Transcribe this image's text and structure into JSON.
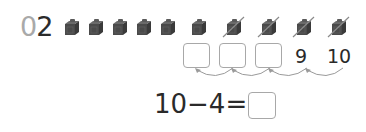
{
  "problem": {
    "number_prefix": "0",
    "number_suffix": "2"
  },
  "cubes": {
    "total": 10,
    "crossed_out": 4,
    "items": [
      {
        "index": 1,
        "crossed": false
      },
      {
        "index": 2,
        "crossed": false
      },
      {
        "index": 3,
        "crossed": false
      },
      {
        "index": 4,
        "crossed": false
      },
      {
        "index": 5,
        "crossed": false
      },
      {
        "index": 6,
        "crossed": false
      },
      {
        "index": 7,
        "crossed": true
      },
      {
        "index": 8,
        "crossed": true
      },
      {
        "index": 9,
        "crossed": true
      },
      {
        "index": 10,
        "crossed": true
      }
    ],
    "color": "#4a4a4a"
  },
  "count_back": {
    "blanks": [
      "",
      "",
      ""
    ],
    "given": [
      "9",
      "10"
    ],
    "arrow_direction": "right-to-left"
  },
  "equation": {
    "text": "10−4=",
    "answer": ""
  },
  "colors": {
    "box_border": "#a8a8a8",
    "arrow": "#9a9a9a",
    "text": "#2a2a2a",
    "prefix_gray": "#a9a9a9"
  }
}
